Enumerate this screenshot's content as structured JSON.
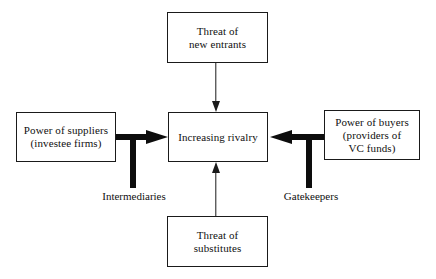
{
  "diagram": {
    "colors": {
      "background": "#ffffff",
      "stroke": "#1a1a1a",
      "thick_stroke": "#0d0d0d",
      "text": "#101010"
    },
    "nodes": {
      "new_entrants": {
        "line1": "Threat of",
        "line2": "new entrants"
      },
      "suppliers": {
        "line1": "Power of suppliers",
        "line2": "(investee firms)"
      },
      "rivalry": {
        "line1": "Increasing rivalry"
      },
      "buyers": {
        "line1": "Power of buyers",
        "line2": "(providers of",
        "line3": "VC funds)"
      },
      "substitutes": {
        "line1": "Threat of",
        "line2": "substitutes"
      }
    },
    "edge_labels": {
      "intermediaries": "Intermediaries",
      "gatekeepers": "Gatekeepers"
    },
    "arrows": {
      "entrants_to_rivalry": "arrow-down",
      "substitutes_to_rivalry": "arrow-up",
      "suppliers_to_rivalry": "thick-arrow-right",
      "buyers_to_rivalry": "thick-arrow-left"
    }
  }
}
